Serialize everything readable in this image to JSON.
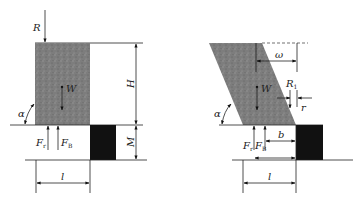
{
  "figure": {
    "left_panel": {
      "labels": {
        "R": "R",
        "W": "W",
        "H": "H",
        "M": "M",
        "alpha": "α",
        "F": "F",
        "F_sub_r": "r",
        "F_sub_B": "B",
        "l": "l"
      }
    },
    "right_panel": {
      "labels": {
        "omega": "ω",
        "W": "W",
        "R": "R",
        "R_sub": "1",
        "r": "r",
        "alpha": "α",
        "F": "F",
        "F_sub_r": "r",
        "F_sub_B": "B",
        "b": "b",
        "l": "l"
      }
    },
    "colors": {
      "block_fill": "#7a7a7a",
      "foundation_fill": "#111111",
      "line": "#222222"
    }
  }
}
